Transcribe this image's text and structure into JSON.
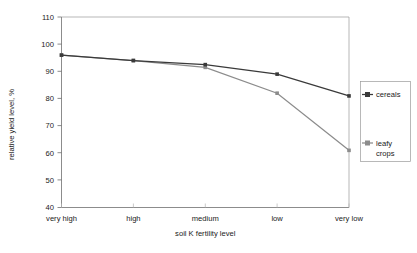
{
  "chart_data": {
    "type": "line",
    "title": "",
    "xlabel": "soil K fertility level",
    "ylabel": "relative yield level, %",
    "categories": [
      "very high",
      "high",
      "medium",
      "low",
      "very low"
    ],
    "series": [
      {
        "name": "cereals",
        "values": [
          96,
          94,
          92.5,
          89,
          81
        ],
        "color": "#3a3a3a",
        "marker": "square"
      },
      {
        "name": "leafy crops",
        "values": [
          96,
          94,
          91.5,
          82,
          61
        ],
        "color": "#8c8c8c",
        "marker": "square"
      }
    ],
    "ylim": [
      40,
      110
    ],
    "yticks": [
      40,
      50,
      60,
      70,
      80,
      90,
      100,
      110
    ],
    "ytick_labels": [
      "40",
      "50",
      "60",
      "70",
      "80",
      "90",
      "100",
      "110"
    ],
    "grid": false,
    "legend_position": "right",
    "legend_entries": [
      "cereals",
      "leafy crops"
    ]
  },
  "legend": {
    "entries": [
      {
        "line1": "cereals",
        "line2": ""
      },
      {
        "line1": "leafy",
        "line2": "crops"
      }
    ]
  },
  "colors": {
    "cereals": "#3a3a3a",
    "leafy_crops": "#8c8c8c",
    "axis": "#6f6f6f",
    "frame": "#9a9a9a",
    "background": "#ffffff"
  }
}
